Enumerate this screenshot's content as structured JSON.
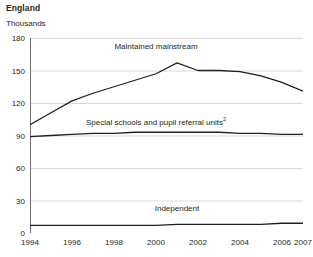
{
  "header": {
    "title": "England",
    "unit_label": "Thousands"
  },
  "chart_data": {
    "type": "line",
    "title": "England",
    "subtitle": "",
    "xlabel": "",
    "ylabel": "Thousands",
    "ylim": [
      0,
      180
    ],
    "xlim": [
      1994,
      2007
    ],
    "yticks": [
      0,
      30,
      60,
      90,
      120,
      150,
      180
    ],
    "xticks": [
      1994,
      1996,
      1998,
      2000,
      2002,
      2004,
      2006,
      2007
    ],
    "grid": "horizontal",
    "legend_position": "inline-annotations",
    "line_color": "#231f20",
    "grid_color": "#d9d9d9",
    "axis_color": "#6d6e71",
    "x": [
      1994,
      1995,
      1996,
      1997,
      1998,
      1999,
      2000,
      2001,
      2002,
      2003,
      2004,
      2005,
      2006,
      2007
    ],
    "series": [
      {
        "name": "Maintained mainstream",
        "label": "Maintained mainstream",
        "label_x": 2000,
        "label_y": 172,
        "values": [
          100,
          111,
          122,
          129,
          135,
          141,
          147,
          157,
          150,
          150,
          149,
          145,
          139,
          131
        ]
      },
      {
        "name": "Special schools and pupil referral units",
        "label": "Special schools and pupil referral units",
        "label_footnote": "2",
        "label_x": 2000,
        "label_y": 103,
        "values": [
          89,
          90,
          91,
          92,
          92,
          93,
          93,
          93,
          93,
          93,
          92,
          92,
          91,
          91
        ]
      },
      {
        "name": "Independent",
        "label": "Independent",
        "label_x": 2001,
        "label_y": 22,
        "values": [
          7,
          7,
          7,
          7,
          7,
          7,
          7,
          8,
          8,
          8,
          8,
          8,
          9,
          9
        ]
      }
    ]
  }
}
